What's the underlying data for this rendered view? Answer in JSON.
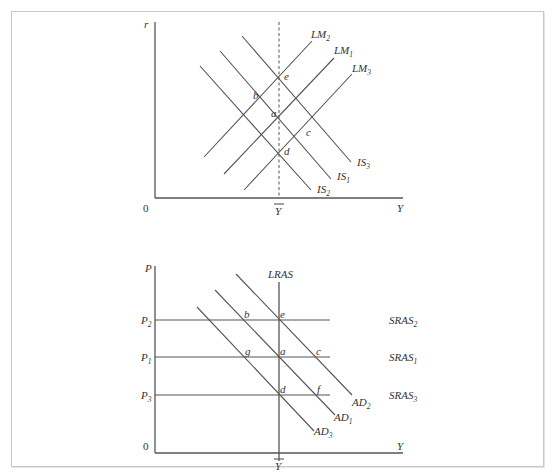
{
  "figure": {
    "top_panel": {
      "type": "IS-LM diagram",
      "y_axis_label": "r",
      "x_axis_label": "Y",
      "origin_label": "0",
      "potential_output_label": "Y",
      "potential_output_bar": true,
      "curves": {
        "LM2": {
          "name": "LM",
          "sub": "2"
        },
        "LM1": {
          "name": "LM",
          "sub": "1"
        },
        "LM3": {
          "name": "LM",
          "sub": "3"
        },
        "IS3": {
          "name": "IS",
          "sub": "3"
        },
        "IS1": {
          "name": "IS",
          "sub": "1"
        },
        "IS2": {
          "name": "IS",
          "sub": "2"
        }
      },
      "points": {
        "e": "e",
        "b": "b",
        "a": "a",
        "c": "c",
        "d": "d"
      }
    },
    "bottom_panel": {
      "type": "AD-AS diagram",
      "y_axis_label": "P",
      "x_axis_label": "Y",
      "origin_label": "0",
      "potential_output_label": "Y",
      "lras_label": "LRAS",
      "price_levels": {
        "P2": {
          "name": "P",
          "sub": "2"
        },
        "P1": {
          "name": "P",
          "sub": "1"
        },
        "P3": {
          "name": "P",
          "sub": "3"
        }
      },
      "curves": {
        "SRAS2": {
          "name": "SRAS",
          "sub": "2"
        },
        "SRAS1": {
          "name": "SRAS",
          "sub": "1"
        },
        "SRAS3": {
          "name": "SRAS",
          "sub": "3"
        },
        "AD2": {
          "name": "AD",
          "sub": "2"
        },
        "AD1": {
          "name": "AD",
          "sub": "1"
        },
        "AD3": {
          "name": "AD",
          "sub": "3"
        }
      },
      "points": {
        "b": "b",
        "e": "e",
        "g": "g",
        "a": "a",
        "c": "c",
        "d": "d",
        "f": "f"
      }
    }
  }
}
